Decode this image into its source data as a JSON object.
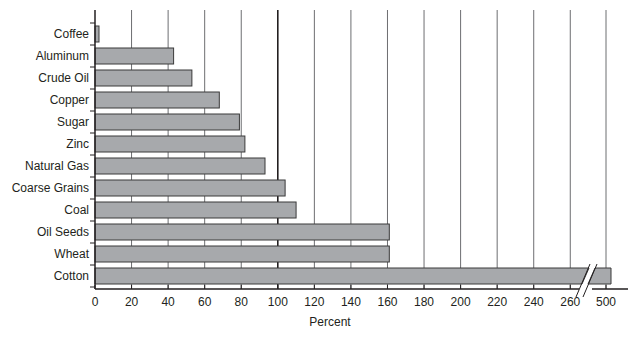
{
  "chart_data": {
    "type": "bar",
    "orientation": "horizontal",
    "title": "",
    "xlabel": "Percent",
    "ylabel": "",
    "categories": [
      "Coffee",
      "Aluminum",
      "Crude Oil",
      "Copper",
      "Sugar",
      "Zinc",
      "Natural Gas",
      "Coarse Grains",
      "Coal",
      "Oil Seeds",
      "Wheat",
      "Cotton"
    ],
    "values": [
      2,
      43,
      53,
      68,
      79,
      82,
      93,
      104,
      110,
      161,
      161,
      505
    ],
    "x_ticks": [
      "0",
      "20",
      "40",
      "60",
      "80",
      "100",
      "120",
      "140",
      "160",
      "180",
      "200",
      "220",
      "240",
      "260",
      "500"
    ],
    "xlim": [
      0,
      500
    ],
    "axis_break": {
      "between": [
        260,
        500
      ]
    },
    "grid": "vertical",
    "emphasized_gridline": 100,
    "legend": null,
    "colors": {
      "bar_fill": "#a7a9ac",
      "bar_stroke": "#3a3a3a",
      "grid": "#6d6e71",
      "axis": "#231f20"
    }
  }
}
